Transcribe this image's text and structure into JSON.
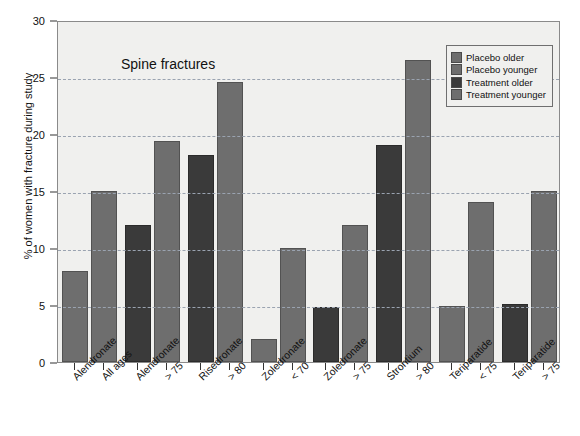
{
  "chart_data": {
    "type": "bar",
    "title": "Spine fractures",
    "xlabel": "",
    "ylabel": "% of women with fracture during study",
    "ylim": [
      0,
      30
    ],
    "ytick_values": [
      0,
      5,
      10,
      15,
      20,
      25,
      30
    ],
    "ytick_labels": [
      "0",
      "5",
      "10",
      "15",
      "20",
      "25",
      "30"
    ],
    "grid": true,
    "legend_position": "top-right",
    "legend": [
      {
        "label": "Placebo older",
        "color": "#6e6e6e"
      },
      {
        "label": "Placebo younger",
        "color": "#6e6e6e"
      },
      {
        "label": "Treatment older",
        "color": "#3a3a3a"
      },
      {
        "label": "Treatment younger",
        "color": "#6e6e6e"
      }
    ],
    "categories": [
      {
        "drug": "Alendronate",
        "age": "All ages"
      },
      {
        "drug": "Alendronate",
        "age": "> 75"
      },
      {
        "drug": "Risedronate",
        "age": "> 80"
      },
      {
        "drug": "Zoledronate",
        "age": "< 70"
      },
      {
        "drug": "Zoledronate",
        "age": "> 75"
      },
      {
        "drug": "Strontium",
        "age": "> 80"
      },
      {
        "drug": "Teriparatide",
        "age": "< 75"
      },
      {
        "drug": "Teriparatide",
        "age": "> 75"
      }
    ],
    "tick_labels": [
      "Alendronate",
      "All ages",
      "Alendronate",
      "> 75",
      "Risedronate",
      "> 80",
      "Zoledronate",
      "< 70",
      "Zoledronate",
      "> 75",
      "Strontium",
      "> 80",
      "Teriparatide",
      "< 75",
      "Teriparatide",
      "> 75"
    ],
    "bars": [
      {
        "group": "Alendronate All ages",
        "series": "Placebo older",
        "value": 8.0,
        "color": "#6e6e6e"
      },
      {
        "group": "Alendronate All ages",
        "series": "Placebo younger",
        "value": 15.0,
        "color": "#6e6e6e"
      },
      {
        "group": "Alendronate > 75",
        "series": "Treatment older",
        "value": 12.0,
        "color": "#3a3a3a"
      },
      {
        "group": "Alendronate > 75",
        "series": "Treatment younger",
        "value": 19.4,
        "color": "#6e6e6e"
      },
      {
        "group": "Risedronate > 80",
        "series": "Treatment older",
        "value": 18.2,
        "color": "#3a3a3a"
      },
      {
        "group": "Risedronate > 80",
        "series": "Treatment younger",
        "value": 24.6,
        "color": "#6e6e6e"
      },
      {
        "group": "Zoledronate < 70",
        "series": "Placebo older",
        "value": 2.0,
        "color": "#6e6e6e"
      },
      {
        "group": "Zoledronate < 70",
        "series": "Placebo younger",
        "value": 10.0,
        "color": "#6e6e6e"
      },
      {
        "group": "Zoledronate > 75",
        "series": "Treatment older",
        "value": 4.8,
        "color": "#3a3a3a"
      },
      {
        "group": "Zoledronate > 75",
        "series": "Treatment younger",
        "value": 12.0,
        "color": "#6e6e6e"
      },
      {
        "group": "Strontium > 80",
        "series": "Treatment older",
        "value": 19.0,
        "color": "#3a3a3a"
      },
      {
        "group": "Strontium > 80",
        "series": "Treatment younger",
        "value": 26.5,
        "color": "#6e6e6e"
      },
      {
        "group": "Teriparatide < 75",
        "series": "Placebo older",
        "value": 4.9,
        "color": "#6e6e6e"
      },
      {
        "group": "Teriparatide < 75",
        "series": "Placebo younger",
        "value": 14.0,
        "color": "#6e6e6e"
      },
      {
        "group": "Teriparatide > 75",
        "series": "Treatment older",
        "value": 5.1,
        "color": "#3a3a3a"
      },
      {
        "group": "Teriparatide > 75",
        "series": "Treatment younger",
        "value": 15.0,
        "color": "#6e6e6e"
      }
    ],
    "colors": {
      "plot_background": "#f0f0ee",
      "page_background": "#ffffff",
      "grid": "#9aa3b0",
      "axis": "#333333",
      "bar_light": "#6e6e6e",
      "bar_dark": "#3a3a3a"
    }
  }
}
